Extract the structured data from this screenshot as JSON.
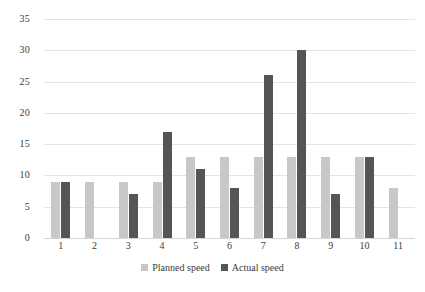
{
  "chart_data": {
    "type": "bar",
    "title": "",
    "subtitle": "",
    "xlabel": "",
    "ylabel": "",
    "categories": [
      "1",
      "2",
      "3",
      "4",
      "5",
      "6",
      "7",
      "8",
      "9",
      "10",
      "11"
    ],
    "series": [
      {
        "name": "Planned speed",
        "color": "#c8c8c8",
        "values": [
          9,
          9,
          9,
          9,
          13,
          13,
          13,
          13,
          13,
          13,
          8
        ]
      },
      {
        "name": "Actual speed",
        "color": "#555555",
        "values": [
          9,
          0,
          7,
          17,
          11,
          8,
          26,
          30,
          7,
          13,
          0
        ]
      }
    ],
    "ylim": [
      0,
      35
    ],
    "yticks": [
      "0",
      "5",
      "10",
      "15",
      "20",
      "25",
      "30",
      "35"
    ],
    "ytick_values": [
      0,
      5,
      10,
      15,
      20,
      25,
      30,
      35
    ],
    "grid": true,
    "legend_position": "bottom"
  },
  "legend": {
    "items": [
      {
        "label": "Planned speed",
        "swatch": "planned-swatch"
      },
      {
        "label": "Actual speed",
        "swatch": "actual-swatch"
      }
    ]
  }
}
